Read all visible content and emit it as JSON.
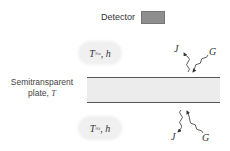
{
  "detector": {
    "label": "Detector",
    "color": "#8e8e8e"
  },
  "top_medium": {
    "T": "T",
    "subscript": "∞o",
    "rest": ", h"
  },
  "bottom_medium": {
    "T": "T",
    "subscript": "∞i",
    "rest": ", h"
  },
  "plate": {
    "label_line1": "Semitransparent",
    "label_line2": "plate, ",
    "label_var": "T"
  },
  "radiation": {
    "top_J": "J",
    "top_G": "G",
    "bottom_J": "J",
    "bottom_G": "G"
  }
}
